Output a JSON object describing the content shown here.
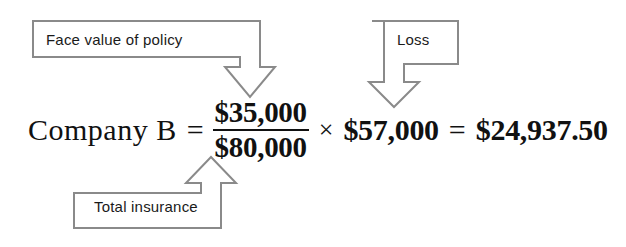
{
  "figure": {
    "type": "annotated-formula"
  },
  "annotations": [
    {
      "id": "face-value",
      "label": "Face value of policy",
      "points_to": "numerator"
    },
    {
      "id": "loss",
      "label": "Loss",
      "points_to": "multiplier"
    },
    {
      "id": "total-insurance",
      "label": "Total insurance",
      "points_to": "denominator"
    }
  ],
  "equation": {
    "lhs": "Company B",
    "equals_1": "=",
    "numerator": "$35,000",
    "denominator": "$80,000",
    "times": "×",
    "loss_value": "$57,000",
    "equals_2": "=",
    "result": "$24,937.50"
  },
  "colors": {
    "outline": "#8a8a8a",
    "text": "#1a1a1a",
    "equation_text": "#111111",
    "background": "#ffffff"
  }
}
